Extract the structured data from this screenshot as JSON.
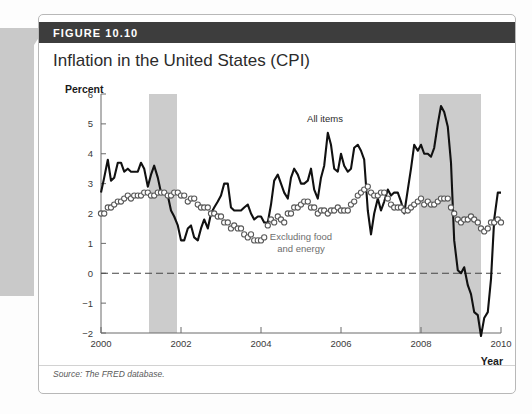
{
  "figure": {
    "header_label": "FIGURE 10.10",
    "title": "Inflation in the United States (CPI)",
    "source": "Source: The FRED database.",
    "header_bg": "#3d3d3d"
  },
  "annotations": {
    "all_items": "All items",
    "core_line1": "Excluding food",
    "core_line2": "and energy"
  },
  "chart_data": {
    "type": "line",
    "title": "Inflation in the United States (CPI)",
    "xlabel": "Year",
    "ylabel": "Percent",
    "xlim": [
      2000,
      2010
    ],
    "ylim": [
      -2,
      6
    ],
    "xticks": [
      2000,
      2002,
      2004,
      2006,
      2008,
      2010
    ],
    "yticks": [
      -2,
      -1,
      0,
      1,
      2,
      3,
      4,
      5,
      6
    ],
    "grid": false,
    "zero_line": 0,
    "legend_position": "inline-annotations",
    "shaded_regions": [
      {
        "label": "recession",
        "start": 2001.2,
        "end": 2001.9,
        "color": "#cccccc"
      },
      {
        "label": "recession",
        "start": 2007.95,
        "end": 2009.5,
        "color": "#cccccc"
      }
    ],
    "series": [
      {
        "name": "All items",
        "style": "solid-black-line",
        "color": "#111111",
        "x": [
          2000.0,
          2000.08,
          2000.17,
          2000.25,
          2000.33,
          2000.42,
          2000.5,
          2000.58,
          2000.67,
          2000.75,
          2000.83,
          2000.92,
          2001.0,
          2001.08,
          2001.17,
          2001.25,
          2001.33,
          2001.42,
          2001.5,
          2001.58,
          2001.67,
          2001.75,
          2001.83,
          2001.92,
          2002.0,
          2002.08,
          2002.17,
          2002.25,
          2002.33,
          2002.42,
          2002.5,
          2002.58,
          2002.67,
          2002.75,
          2002.83,
          2002.92,
          2003.0,
          2003.08,
          2003.17,
          2003.25,
          2003.33,
          2003.42,
          2003.5,
          2003.58,
          2003.67,
          2003.75,
          2003.83,
          2003.92,
          2004.0,
          2004.08,
          2004.17,
          2004.25,
          2004.33,
          2004.42,
          2004.5,
          2004.58,
          2004.67,
          2004.75,
          2004.83,
          2004.92,
          2005.0,
          2005.08,
          2005.17,
          2005.25,
          2005.33,
          2005.42,
          2005.5,
          2005.58,
          2005.67,
          2005.75,
          2005.83,
          2005.92,
          2006.0,
          2006.08,
          2006.17,
          2006.25,
          2006.33,
          2006.42,
          2006.5,
          2006.58,
          2006.67,
          2006.75,
          2006.83,
          2006.92,
          2007.0,
          2007.08,
          2007.17,
          2007.25,
          2007.33,
          2007.42,
          2007.5,
          2007.58,
          2007.67,
          2007.75,
          2007.83,
          2007.92,
          2008.0,
          2008.08,
          2008.17,
          2008.25,
          2008.33,
          2008.42,
          2008.5,
          2008.58,
          2008.67,
          2008.75,
          2008.83,
          2008.92,
          2009.0,
          2009.08,
          2009.17,
          2009.25,
          2009.33,
          2009.42,
          2009.5,
          2009.58,
          2009.67,
          2009.75,
          2009.83,
          2009.92,
          2010.0
        ],
        "values": [
          2.7,
          3.2,
          3.8,
          3.1,
          3.2,
          3.7,
          3.7,
          3.4,
          3.5,
          3.4,
          3.4,
          3.4,
          3.7,
          3.5,
          2.9,
          3.3,
          3.6,
          3.2,
          2.7,
          2.7,
          2.6,
          2.1,
          1.9,
          1.6,
          1.1,
          1.1,
          1.5,
          1.6,
          1.2,
          1.1,
          1.5,
          1.8,
          1.5,
          2.0,
          2.2,
          2.4,
          2.6,
          3.0,
          3.0,
          2.2,
          2.1,
          2.1,
          2.1,
          2.2,
          2.3,
          2.0,
          1.8,
          1.9,
          1.9,
          1.7,
          1.7,
          2.3,
          3.1,
          3.3,
          3.0,
          2.7,
          2.5,
          3.2,
          3.5,
          3.3,
          3.0,
          3.0,
          3.1,
          3.5,
          2.8,
          2.5,
          3.2,
          3.6,
          4.7,
          4.3,
          3.5,
          3.4,
          4.0,
          3.6,
          3.4,
          3.5,
          4.2,
          4.3,
          4.1,
          3.8,
          2.1,
          1.3,
          2.0,
          2.5,
          2.1,
          2.4,
          2.8,
          2.6,
          2.7,
          2.7,
          2.4,
          2.0,
          2.8,
          3.5,
          4.3,
          4.1,
          4.3,
          4.0,
          4.0,
          3.9,
          4.2,
          5.0,
          5.6,
          5.4,
          4.9,
          3.7,
          1.1,
          0.1,
          0.0,
          0.2,
          -0.4,
          -0.7,
          -1.3,
          -1.4,
          -2.1,
          -1.5,
          -1.3,
          -0.2,
          1.8,
          2.7,
          2.7
        ]
      },
      {
        "name": "Excluding food and energy",
        "style": "open-circle-markers",
        "color": "#5a5a5a",
        "x": [
          2000.0,
          2000.08,
          2000.17,
          2000.25,
          2000.33,
          2000.42,
          2000.5,
          2000.58,
          2000.67,
          2000.75,
          2000.83,
          2000.92,
          2001.0,
          2001.08,
          2001.17,
          2001.25,
          2001.33,
          2001.42,
          2001.5,
          2001.58,
          2001.67,
          2001.75,
          2001.83,
          2001.92,
          2002.0,
          2002.08,
          2002.17,
          2002.25,
          2002.33,
          2002.42,
          2002.5,
          2002.58,
          2002.67,
          2002.75,
          2002.83,
          2002.92,
          2003.0,
          2003.08,
          2003.17,
          2003.25,
          2003.33,
          2003.42,
          2003.5,
          2003.58,
          2003.67,
          2003.75,
          2003.83,
          2003.92,
          2004.0,
          2004.08,
          2004.17,
          2004.25,
          2004.33,
          2004.42,
          2004.5,
          2004.58,
          2004.67,
          2004.75,
          2004.83,
          2004.92,
          2005.0,
          2005.08,
          2005.17,
          2005.25,
          2005.33,
          2005.42,
          2005.5,
          2005.58,
          2005.67,
          2005.75,
          2005.83,
          2005.92,
          2006.0,
          2006.08,
          2006.17,
          2006.25,
          2006.33,
          2006.42,
          2006.5,
          2006.58,
          2006.67,
          2006.75,
          2006.83,
          2006.92,
          2007.0,
          2007.08,
          2007.17,
          2007.25,
          2007.33,
          2007.42,
          2007.5,
          2007.58,
          2007.67,
          2007.75,
          2007.83,
          2007.92,
          2008.0,
          2008.08,
          2008.17,
          2008.25,
          2008.33,
          2008.42,
          2008.5,
          2008.58,
          2008.67,
          2008.75,
          2008.83,
          2008.92,
          2009.0,
          2009.08,
          2009.17,
          2009.25,
          2009.33,
          2009.42,
          2009.5,
          2009.58,
          2009.67,
          2009.75,
          2009.83,
          2009.92,
          2010.0
        ],
        "values": [
          2.0,
          2.0,
          2.2,
          2.2,
          2.3,
          2.4,
          2.4,
          2.5,
          2.6,
          2.5,
          2.6,
          2.6,
          2.6,
          2.7,
          2.7,
          2.6,
          2.6,
          2.7,
          2.7,
          2.7,
          2.6,
          2.6,
          2.7,
          2.7,
          2.6,
          2.6,
          2.4,
          2.5,
          2.5,
          2.3,
          2.2,
          2.2,
          2.2,
          2.0,
          2.0,
          1.9,
          1.9,
          1.7,
          1.7,
          1.5,
          1.6,
          1.5,
          1.5,
          1.3,
          1.2,
          1.3,
          1.1,
          1.1,
          1.1,
          1.2,
          1.6,
          1.8,
          1.7,
          1.9,
          1.8,
          1.7,
          2.0,
          2.0,
          2.2,
          2.2,
          2.3,
          2.4,
          2.4,
          2.2,
          2.2,
          2.0,
          2.1,
          2.1,
          2.0,
          2.1,
          2.1,
          2.2,
          2.1,
          2.1,
          2.1,
          2.3,
          2.4,
          2.6,
          2.7,
          2.8,
          2.9,
          2.7,
          2.6,
          2.6,
          2.7,
          2.7,
          2.5,
          2.3,
          2.2,
          2.2,
          2.2,
          2.1,
          2.1,
          2.2,
          2.3,
          2.4,
          2.5,
          2.3,
          2.4,
          2.3,
          2.3,
          2.4,
          2.5,
          2.5,
          2.5,
          2.2,
          2.0,
          1.8,
          1.7,
          1.8,
          1.8,
          1.9,
          1.8,
          1.7,
          1.5,
          1.4,
          1.5,
          1.7,
          1.7,
          1.8,
          1.7
        ]
      }
    ]
  }
}
